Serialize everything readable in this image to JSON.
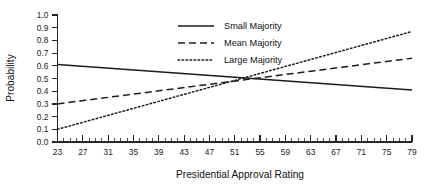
{
  "chart_data": {
    "type": "line",
    "title": "",
    "xlabel": "Presidential Approval Rating",
    "ylabel": "Probability",
    "xlim": [
      23,
      79
    ],
    "ylim": [
      0.0,
      1.0
    ],
    "grid": false,
    "legend_position": "top-center",
    "x_tick_labels": [
      "23",
      "27",
      "31",
      "35",
      "39",
      "43",
      "47",
      "51",
      "55",
      "59",
      "63",
      "67",
      "71",
      "75",
      "79"
    ],
    "x_tick_values": [
      23,
      27,
      31,
      35,
      39,
      43,
      47,
      51,
      55,
      59,
      63,
      67,
      71,
      75,
      79
    ],
    "x_minor_tick_step": 1,
    "y_tick_labels": [
      "0.0",
      "0.1",
      "0.2",
      "0.3",
      "0.4",
      "0.5",
      "0.6",
      "0.7",
      "0.8",
      "0.9",
      "1.0"
    ],
    "y_tick_values": [
      0.0,
      0.1,
      0.2,
      0.3,
      0.4,
      0.5,
      0.6,
      0.7,
      0.8,
      0.9,
      1.0
    ],
    "x": [
      23,
      79
    ],
    "series": [
      {
        "name": "Small Majority",
        "style": "solid",
        "color": "#1c1c1c",
        "x": [
          23,
          79
        ],
        "values": [
          0.61,
          0.41
        ]
      },
      {
        "name": "Mean Majority",
        "style": "dashed",
        "color": "#1c1c1c",
        "x": [
          23,
          79
        ],
        "values": [
          0.3,
          0.66
        ]
      },
      {
        "name": "Large Majority",
        "style": "dotted",
        "color": "#1c1c1c",
        "x": [
          23,
          79
        ],
        "values": [
          0.1,
          0.87
        ]
      }
    ],
    "annotations": [
      {
        "text": "All three lines intersect near approval 53 at probability 0.50"
      }
    ]
  },
  "legend": {
    "items": [
      {
        "label": "Small Majority",
        "style": "solid"
      },
      {
        "label": "Mean Majority",
        "style": "dashed"
      },
      {
        "label": "Large Majority",
        "style": "dotted"
      }
    ]
  },
  "colors": {
    "ink": "#1c1c1c",
    "background": "#ffffff"
  }
}
